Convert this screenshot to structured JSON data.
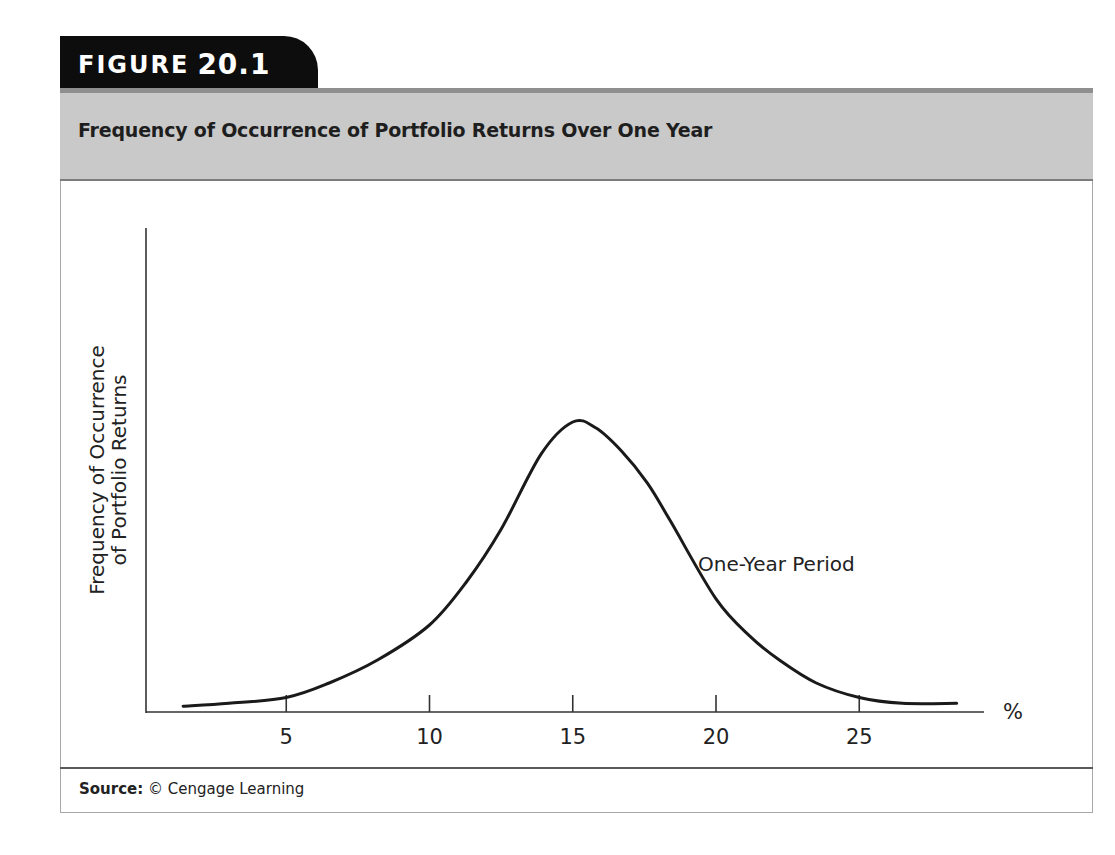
{
  "figure": {
    "label_word": "FIGURE",
    "label_number": "20.1",
    "title": "Frequency of Occurrence of Portfolio Returns Over One Year",
    "source_label": "Source:",
    "source_text": "© Cengage Learning"
  },
  "colors": {
    "tab_bg": "#0d0d0d",
    "header_bg": "#c9c9c9",
    "curve": "#1a1a1a",
    "axis": "#333333"
  },
  "chart_data": {
    "type": "line",
    "title": "Frequency of Occurrence of Portfolio Returns Over One Year",
    "xlabel": "%",
    "ylabel": "Frequency of Occurrence of Portfolio Returns",
    "ylabel_lines": [
      "Frequency of Occurrence",
      "of Portfolio Returns"
    ],
    "xlim": [
      0,
      30
    ],
    "ylim": [
      0,
      100
    ],
    "x_ticks": [
      5,
      10,
      15,
      20,
      25
    ],
    "y_ticks": [],
    "grid": false,
    "legend": null,
    "annotations": [
      {
        "text": "One-Year Period",
        "x": 19.5,
        "y": 52
      }
    ],
    "series": [
      {
        "name": "One-Year Period",
        "x": [
          1.4,
          3.0,
          5.0,
          6.5,
          8.2,
          10.0,
          11.3,
          12.5,
          13.9,
          15.0,
          15.8,
          16.7,
          17.6,
          18.4,
          20.0,
          21.2,
          22.2,
          23.5,
          25.0,
          26.5,
          28.4
        ],
        "values": [
          2,
          3,
          5,
          10,
          18,
          30,
          45,
          63,
          89,
          100,
          98,
          90,
          79,
          66,
          39,
          26,
          18,
          10,
          5,
          3,
          3
        ]
      }
    ]
  }
}
